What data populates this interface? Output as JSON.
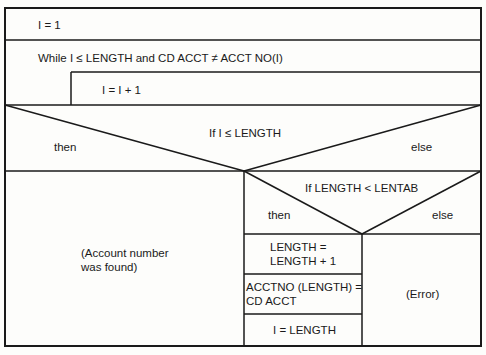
{
  "diagram": {
    "type": "nassi-shneiderman",
    "blocks": {
      "init": "I = 1",
      "loop_condition": "While I ≤ LENGTH and CD ACCT ≠ ACCT NO(I)",
      "loop_body": "I = I + 1",
      "if1": {
        "condition": "If I ≤ LENGTH",
        "then_label": "then",
        "else_label": "else",
        "then_body": [
          "(Account number",
          "was found)"
        ]
      },
      "if2": {
        "condition": "If LENGTH < LENTAB",
        "then_label": "then",
        "else_label": "else",
        "then_steps": [
          [
            "LENGTH =",
            "LENGTH + 1"
          ],
          [
            "ACCTNO (LENGTH) =",
            "CD ACCT"
          ],
          [
            "I = LENGTH"
          ]
        ],
        "else_body": "(Error)"
      }
    },
    "colors": {
      "line": "#1a1a1a",
      "background": "#fdfdfb"
    }
  }
}
